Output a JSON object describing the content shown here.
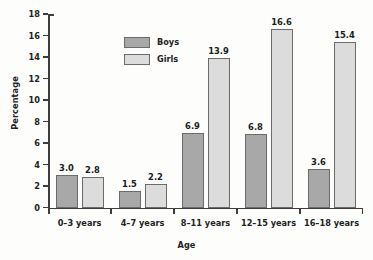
{
  "chart_data": {
    "type": "bar",
    "title": "",
    "xlabel": "Age",
    "ylabel": "Percentage",
    "categories": [
      "0–3 years",
      "4–7 years",
      "8–11 years",
      "12–15 years",
      "16–18 years"
    ],
    "series": [
      {
        "name": "Boys",
        "color": "#a8a8a8",
        "values": [
          3.0,
          1.5,
          6.9,
          6.8,
          3.6
        ],
        "labels": [
          "3.0",
          "1.5",
          "6.9",
          "6.8",
          "3.6"
        ]
      },
      {
        "name": "Girls",
        "color": "#dcdcdc",
        "values": [
          2.8,
          2.2,
          13.9,
          16.6,
          15.4
        ],
        "labels": [
          "2.8",
          "2.2",
          "13.9",
          "16.6",
          "15.4"
        ]
      }
    ],
    "ylim": [
      0,
      18
    ],
    "yticks": [
      0,
      2,
      4,
      6,
      8,
      10,
      12,
      14,
      16,
      18
    ],
    "ytick_labels": [
      "0",
      "2",
      "4",
      "6",
      "8",
      "10",
      "12",
      "14",
      "16",
      "18"
    ],
    "grid": false,
    "legend_position": "top-left-inside",
    "bar_border_color": "#6b6b6b",
    "axis_color": "#3d3d3d",
    "background": "#fdfdfb"
  },
  "legend": {
    "items": [
      {
        "label": "Boys"
      },
      {
        "label": "Girls"
      }
    ]
  }
}
